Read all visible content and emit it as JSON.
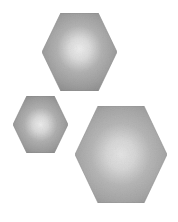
{
  "scene": {
    "title": "Three shaded hexagons",
    "background_color": "#ffffff",
    "width": 178,
    "height": 222
  },
  "palette": {
    "highlight_color": "#ededed",
    "mid_color": "#b4b4b4",
    "edge_color": "#8d8d8d",
    "outline_color": "#8a8a8a"
  },
  "shapes": [
    {
      "name": "hexagon-top",
      "label": "Large upper hexagon",
      "orientation": "flat-top",
      "center_x": 79.5,
      "center_y": 52,
      "radius_x": 37.5,
      "radius_y": 39,
      "highlight_x": 0.5,
      "highlight_y": 0.46,
      "highlight_color": "#ededed",
      "mid_color": "#b2b2b2",
      "edge_color": "#8b8b8b"
    },
    {
      "name": "hexagon-small",
      "label": "Small left hexagon",
      "orientation": "flat-top",
      "center_x": 40.5,
      "center_y": 124.5,
      "radius_x": 27.5,
      "radius_y": 28.5,
      "highlight_x": 0.5,
      "highlight_y": 0.5,
      "highlight_color": "#ececec",
      "mid_color": "#b0b0b0",
      "edge_color": "#878787"
    },
    {
      "name": "hexagon-large",
      "label": "Largest lower right hexagon",
      "orientation": "flat-top",
      "center_x": 121,
      "center_y": 154.5,
      "radius_x": 46,
      "radius_y": 48.5,
      "highlight_x": 0.5,
      "highlight_y": 0.5,
      "highlight_color": "#e4e4e4",
      "mid_color": "#b6b6b6",
      "edge_color": "#909090"
    }
  ]
}
